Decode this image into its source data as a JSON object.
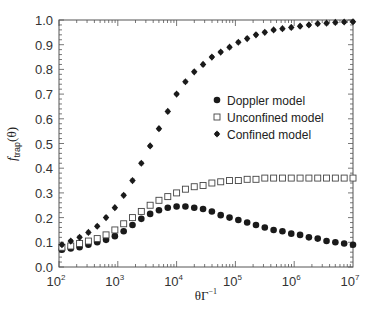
{
  "chart_data": {
    "type": "scatter",
    "title": "",
    "xlabel": "θΓ⁻¹",
    "ylabel": "f_trap(θ)",
    "xscale": "log",
    "xlim": [
      100,
      10000000
    ],
    "ylim": [
      0.0,
      1.0
    ],
    "x_ticks": [
      "10^2",
      "10^3",
      "10^4",
      "10^5",
      "10^6",
      "10^7"
    ],
    "y_ticks": [
      "0.0",
      "0.1",
      "0.2",
      "0.3",
      "0.4",
      "0.5",
      "0.6",
      "0.7",
      "0.8",
      "0.9",
      "1.0"
    ],
    "grid": false,
    "legend_position": "upper-right-center",
    "log10_x": [
      2.05,
      2.2,
      2.35,
      2.5,
      2.65,
      2.8,
      2.95,
      3.1,
      3.25,
      3.4,
      3.55,
      3.7,
      3.85,
      4.0,
      4.15,
      4.3,
      4.45,
      4.6,
      4.75,
      4.9,
      5.05,
      5.2,
      5.35,
      5.5,
      5.65,
      5.8,
      5.95,
      6.1,
      6.25,
      6.4,
      6.55,
      6.7,
      6.85,
      7.0
    ],
    "series": [
      {
        "name": "Doppler model",
        "marker": "filled-circle",
        "values": [
          0.07,
          0.075,
          0.08,
          0.09,
          0.1,
          0.11,
          0.125,
          0.145,
          0.17,
          0.195,
          0.215,
          0.23,
          0.24,
          0.245,
          0.245,
          0.24,
          0.235,
          0.225,
          0.21,
          0.2,
          0.19,
          0.18,
          0.17,
          0.16,
          0.15,
          0.145,
          0.135,
          0.13,
          0.12,
          0.115,
          0.105,
          0.1,
          0.095,
          0.09
        ]
      },
      {
        "name": "Unconfined model",
        "marker": "open-square",
        "values": [
          0.08,
          0.085,
          0.095,
          0.105,
          0.115,
          0.13,
          0.15,
          0.175,
          0.2,
          0.225,
          0.25,
          0.27,
          0.285,
          0.3,
          0.315,
          0.325,
          0.33,
          0.34,
          0.345,
          0.35,
          0.35,
          0.355,
          0.355,
          0.36,
          0.36,
          0.36,
          0.36,
          0.36,
          0.36,
          0.36,
          0.36,
          0.36,
          0.36,
          0.36
        ]
      },
      {
        "name": "Confined model",
        "marker": "filled-diamond",
        "values": [
          0.09,
          0.105,
          0.12,
          0.14,
          0.165,
          0.2,
          0.24,
          0.29,
          0.35,
          0.42,
          0.49,
          0.56,
          0.63,
          0.7,
          0.75,
          0.79,
          0.82,
          0.85,
          0.87,
          0.89,
          0.91,
          0.925,
          0.94,
          0.95,
          0.96,
          0.965,
          0.97,
          0.975,
          0.98,
          0.985,
          0.987,
          0.99,
          0.992,
          0.993
        ]
      }
    ]
  },
  "legend": [
    {
      "label": "Doppler model"
    },
    {
      "label": "Unconfined model"
    },
    {
      "label": "Confined model"
    }
  ],
  "axes": {
    "xlabel_main": "θΓ",
    "xlabel_sup": "−1",
    "ylabel_main": "f",
    "ylabel_sub": "trap",
    "ylabel_arg": "(θ)"
  },
  "colors": {
    "axis": "#555555",
    "marker": "#1a1a1a"
  }
}
